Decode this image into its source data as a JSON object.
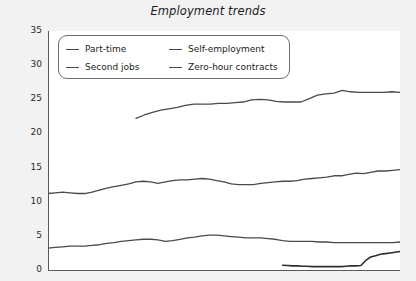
{
  "chart_data": {
    "type": "line",
    "title": "Employment trends",
    "xlabel": "",
    "ylabel": "Percentage of total in employment",
    "ylim": [
      0,
      35
    ],
    "yticks": [
      0,
      5,
      10,
      15,
      20,
      25,
      30,
      35
    ],
    "grid": false,
    "legend_position": "top-left",
    "x_tick_count": 36,
    "x_axis_labels_visible": false,
    "series": [
      {
        "name": "Part-time",
        "color": "#4a4a4a",
        "x_start_index": 9,
        "values": [
          22.2,
          22.7,
          23.1,
          23.4,
          23.6,
          23.8,
          24.1,
          24.3,
          24.3,
          24.3,
          24.4,
          24.4,
          24.5,
          24.6,
          24.9,
          25.0,
          24.9,
          24.7,
          24.6,
          24.6,
          24.6,
          25.1,
          25.6,
          25.8,
          25.9,
          26.3,
          26.1,
          26.0,
          26.0,
          26.0,
          26.0,
          26.1,
          26.0
        ]
      },
      {
        "name": "Self-employment",
        "color": "#4a4a4a",
        "x_start_index": 0,
        "values": [
          11.2,
          11.3,
          11.4,
          11.3,
          11.2,
          11.2,
          11.4,
          11.7,
          12.0,
          12.2,
          12.4,
          12.6,
          12.9,
          13.0,
          12.9,
          12.7,
          12.9,
          13.1,
          13.2,
          13.2,
          13.3,
          13.4,
          13.3,
          13.1,
          12.9,
          12.6,
          12.5,
          12.5,
          12.5,
          12.7,
          12.8,
          12.9,
          13.0,
          13.0,
          13.1,
          13.3,
          13.4,
          13.5,
          13.6,
          13.8,
          13.8,
          14.0,
          14.2,
          14.1,
          14.3,
          14.5,
          14.5,
          14.6,
          14.7
        ]
      },
      {
        "name": "Second jobs",
        "color": "#4a4a4a",
        "x_start_index": 0,
        "values": [
          3.2,
          3.3,
          3.4,
          3.5,
          3.5,
          3.5,
          3.6,
          3.7,
          3.9,
          4.0,
          4.2,
          4.3,
          4.4,
          4.5,
          4.5,
          4.4,
          4.2,
          4.3,
          4.5,
          4.7,
          4.8,
          5.0,
          5.1,
          5.1,
          5.0,
          4.9,
          4.8,
          4.7,
          4.7,
          4.7,
          4.6,
          4.5,
          4.3,
          4.2,
          4.2,
          4.2,
          4.2,
          4.1,
          4.1,
          4.0,
          4.0,
          4.0,
          4.0,
          4.0,
          4.0,
          4.0,
          4.0,
          4.0,
          4.1
        ]
      },
      {
        "name": "Zero-hour contracts",
        "color": "#2e2e2e",
        "x_start_index": 24,
        "values": [
          0.7,
          0.65,
          0.6,
          0.6,
          0.55,
          0.55,
          0.5,
          0.5,
          0.5,
          0.5,
          0.5,
          0.5,
          0.5,
          0.55,
          0.6,
          0.6,
          0.65,
          1.4,
          1.9,
          2.1,
          2.3,
          2.4,
          2.5,
          2.6,
          2.7
        ]
      }
    ]
  },
  "legend": {
    "entries": [
      {
        "label": "Part-time"
      },
      {
        "label": "Self-employment"
      },
      {
        "label": "Second jobs"
      },
      {
        "label": "Zero-hour contracts"
      }
    ]
  }
}
